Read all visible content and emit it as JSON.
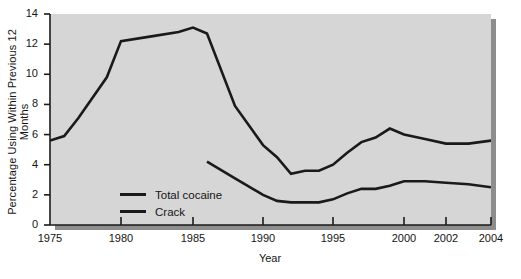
{
  "chart_data": {
    "type": "line",
    "title": "",
    "xlabel": "Year",
    "ylabel": "Percentage Using Within Previous 12 Months",
    "xlim": [
      1975,
      2004
    ],
    "ylim": [
      0,
      14
    ],
    "yticks": [
      0,
      2,
      4,
      6,
      8,
      10,
      12,
      14
    ],
    "xticks": [
      1975,
      1980,
      1985,
      1990,
      1995,
      2000,
      2002,
      2004
    ],
    "xtick_labels": [
      "1975",
      "1980",
      "1985",
      "1990",
      "1995",
      "2000",
      "2002",
      "2004"
    ],
    "ytick_labels": [
      "0",
      "2",
      "4",
      "6",
      "8",
      "10",
      "12",
      "14"
    ],
    "grid": false,
    "legend_position": "inside-lower-left",
    "plot_background": "#d6d6d6",
    "line_color": "#1a1a1a",
    "series": [
      {
        "name": "Total cocaine",
        "x": [
          1975,
          1976,
          1977,
          1979,
          1980,
          1982,
          1984,
          1985,
          1986,
          1988,
          1990,
          1991,
          1992,
          1993,
          1994,
          1995,
          1996,
          1997,
          1998,
          1999,
          2000,
          2001,
          2002,
          2003,
          2004
        ],
        "values": [
          5.6,
          5.9,
          7.1,
          9.8,
          12.2,
          12.5,
          12.8,
          13.1,
          12.7,
          7.9,
          5.3,
          4.5,
          3.4,
          3.6,
          3.6,
          4.0,
          4.8,
          5.5,
          5.8,
          6.4,
          6.0,
          5.7,
          5.4,
          5.4,
          5.6
        ]
      },
      {
        "name": "Crack",
        "x": [
          1986,
          1988,
          1990,
          1991,
          1992,
          1993,
          1994,
          1995,
          1996,
          1997,
          1998,
          1999,
          2000,
          2001,
          2002,
          2003,
          2004
        ],
        "values": [
          4.2,
          3.1,
          2.0,
          1.6,
          1.5,
          1.5,
          1.5,
          1.7,
          2.1,
          2.4,
          2.4,
          2.6,
          2.9,
          2.9,
          2.8,
          2.7,
          2.5
        ]
      }
    ],
    "legend": [
      {
        "label": "Total cocaine"
      },
      {
        "label": "Crack"
      }
    ]
  }
}
